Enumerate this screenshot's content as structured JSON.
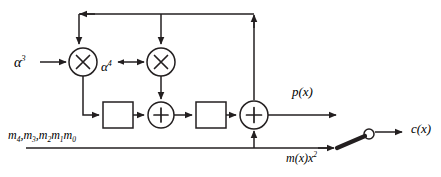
{
  "diagram": {
    "colors": {
      "line": "#231f20",
      "background": "#ffffff",
      "switch_arm": "#231f20"
    },
    "labels": {
      "alpha3": "α",
      "alpha3_exp": "3",
      "alpha4": "α",
      "alpha4_exp": "4",
      "message_inputs": "m",
      "message_inputs_full": "m4, m3, m2m1m0",
      "p_of_x": "p(x)",
      "m_of_x_x2": "m(x)x",
      "m_of_x_x2_exp": "2",
      "c_of_x": "c(x)"
    },
    "nodes": [
      {
        "name": "multiplier-1",
        "type": "multiplier",
        "symbol": "×",
        "cx": 83,
        "cy": 62,
        "r": 14
      },
      {
        "name": "multiplier-2",
        "type": "multiplier",
        "symbol": "×",
        "cx": 161,
        "cy": 62,
        "r": 14
      },
      {
        "name": "adder-1",
        "type": "adder",
        "symbol": "+",
        "cx": 161,
        "cy": 115,
        "r": 13
      },
      {
        "name": "adder-2",
        "type": "adder",
        "symbol": "+",
        "cx": 254,
        "cy": 115,
        "r": 14
      },
      {
        "name": "register-1",
        "type": "register",
        "x": 103,
        "y": 102,
        "w": 30,
        "h": 26
      },
      {
        "name": "register-2",
        "type": "register",
        "x": 196,
        "y": 102,
        "w": 30,
        "h": 26
      },
      {
        "name": "output-switch",
        "type": "switch",
        "pivot_x": 337,
        "pivot_y": 148,
        "contact_cx": 369,
        "contact_cy": 134,
        "contact_r": 5
      }
    ],
    "subscripts": {
      "m4": "4",
      "m3": "3",
      "m2": "2",
      "m1": "1",
      "m0": "0"
    }
  }
}
